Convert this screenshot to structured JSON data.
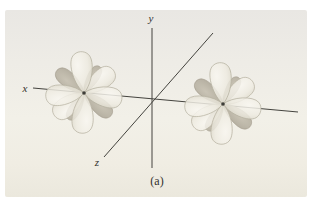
{
  "figure": {
    "caption": "(a)",
    "axes": {
      "x_label": "x",
      "y_label": "y",
      "z_label": "z"
    },
    "orbitals": [
      {
        "id": "d-orbital-left"
      },
      {
        "id": "d-orbital-right"
      }
    ]
  },
  "colors": {
    "axis": "#44433e",
    "ink": "#33322e",
    "dot": "#3e3d38",
    "lobe-edge": "#b5b0a0",
    "lobe-dark-edge": "#9a9484",
    "panel-top": "#e9e7e3",
    "panel-mid": "#f2f0e8",
    "panel-bottom": "#ebe8dd"
  }
}
